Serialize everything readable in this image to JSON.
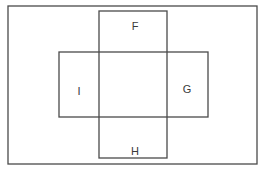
{
  "diagram": {
    "type": "overlapping-rectangles",
    "line_color": "#4a4a4a",
    "background": "#ffffff",
    "outer_frame": {
      "x": 8,
      "y": 6,
      "w": 249,
      "h": 158
    },
    "rectangles": [
      {
        "id": "vertical",
        "x": 99,
        "y": 11,
        "w": 68,
        "h": 147
      },
      {
        "id": "horizontal",
        "x": 59,
        "y": 52,
        "w": 149,
        "h": 65
      }
    ],
    "labels": [
      {
        "id": "F",
        "text": "F",
        "x": 135,
        "y": 30
      },
      {
        "id": "I",
        "text": "I",
        "x": 79,
        "y": 95
      },
      {
        "id": "G",
        "text": "G",
        "x": 187,
        "y": 93
      },
      {
        "id": "H",
        "text": "H",
        "x": 135,
        "y": 155
      }
    ]
  }
}
